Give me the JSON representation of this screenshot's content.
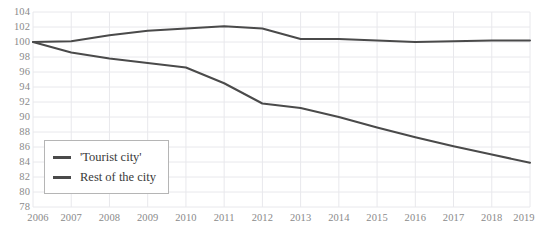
{
  "chart_data": {
    "type": "line",
    "title": "",
    "xlabel": "",
    "ylabel": "",
    "x": [
      2006,
      2007,
      2008,
      2009,
      2010,
      2011,
      2012,
      2013,
      2014,
      2015,
      2016,
      2017,
      2018,
      2019
    ],
    "categories": [
      "2006",
      "2007",
      "2008",
      "2009",
      "2010",
      "2011",
      "2012",
      "2013",
      "2014",
      "2015",
      "2016",
      "2017",
      "2018",
      "2019"
    ],
    "xlim": [
      2006,
      2019
    ],
    "ylim": [
      78,
      104
    ],
    "yticks": [
      78,
      80,
      82,
      84,
      86,
      88,
      90,
      92,
      94,
      96,
      98,
      100,
      102,
      104
    ],
    "ytick_labels": [
      "78",
      "80",
      "82",
      "84",
      "86",
      "88",
      "90",
      "92",
      "94",
      "96",
      "98",
      "100",
      "102",
      "104"
    ],
    "grid": true,
    "legend_position": "lower-left",
    "series": [
      {
        "name": "'Tourist city'",
        "color": "#4a4a4a",
        "values": [
          100.0,
          100.1,
          100.9,
          101.5,
          101.8,
          102.1,
          101.8,
          100.4,
          100.4,
          100.2,
          100.0,
          100.1,
          100.2,
          100.2
        ]
      },
      {
        "name": "Rest of the city",
        "color": "#4a4a4a",
        "values": [
          100.0,
          98.6,
          97.8,
          97.2,
          96.6,
          94.5,
          91.8,
          91.2,
          90.0,
          88.6,
          87.3,
          86.1,
          85.0,
          83.9
        ]
      }
    ]
  },
  "legend": {
    "items": [
      {
        "label": "'Tourist city'",
        "color": "#4a4a4a"
      },
      {
        "label": "Rest of the city",
        "color": "#4a4a4a"
      }
    ]
  },
  "style": {
    "background": "#ffffff",
    "grid_color": "#e8e8ec",
    "axis_text_color": "#8a8a8a",
    "legend_border": "#b5b5b5",
    "line_color": "#4a4a4a"
  }
}
